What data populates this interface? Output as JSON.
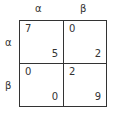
{
  "game": {
    "type": "2x2 normal-form payoff matrix",
    "column_strategies": [
      "α",
      "β"
    ],
    "row_strategies": [
      "α",
      "β"
    ],
    "cells": [
      [
        {
          "row_payoff": "7",
          "col_payoff": "5"
        },
        {
          "row_payoff": "0",
          "col_payoff": "2"
        }
      ],
      [
        {
          "row_payoff": "0",
          "col_payoff": "0"
        },
        {
          "row_payoff": "2",
          "col_payoff": "9"
        }
      ]
    ]
  }
}
